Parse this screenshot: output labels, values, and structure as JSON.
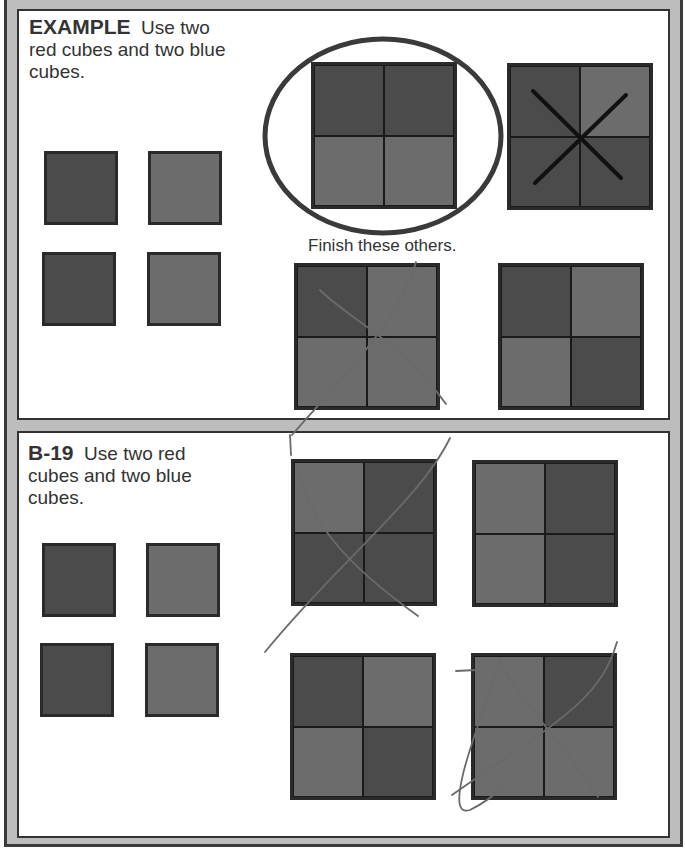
{
  "colors": {
    "frame": "#bdbdbd",
    "dark_cube": "#4b4b4b",
    "light_cube": "#6c6c6c",
    "border": "#2a2a2a"
  },
  "example": {
    "label": "EXAMPLE",
    "instruction_line1": "Use two",
    "instruction_line2": "red cubes and two blue",
    "instruction_line3": "cubes.",
    "loose_cubes": [
      "dark",
      "light",
      "dark",
      "light"
    ],
    "finish_text": "Finish these others.",
    "grids": [
      {
        "name": "circled-grid",
        "cells": [
          "dark",
          "dark",
          "light",
          "light"
        ],
        "mark": "circle"
      },
      {
        "name": "crossed-grid",
        "cells": [
          "dark",
          "light",
          "dark",
          "dark"
        ],
        "mark": "x"
      },
      {
        "name": "finish-grid-1",
        "cells": [
          "dark",
          "light",
          "light",
          "light"
        ],
        "mark": "pencil-x"
      },
      {
        "name": "finish-grid-2",
        "cells": [
          "dark",
          "light",
          "light",
          "dark"
        ],
        "mark": "none"
      }
    ]
  },
  "b19": {
    "label": "B-19",
    "instruction_line1": "Use two red",
    "instruction_line2": "cubes and two blue",
    "instruction_line3": "cubes.",
    "loose_cubes": [
      "dark",
      "light",
      "dark",
      "light"
    ],
    "grids": [
      {
        "name": "b19-grid-1",
        "cells": [
          "light",
          "dark",
          "dark",
          "dark"
        ],
        "mark": "pencil-x"
      },
      {
        "name": "b19-grid-2",
        "cells": [
          "light",
          "dark",
          "light",
          "dark"
        ],
        "mark": "none"
      },
      {
        "name": "b19-grid-3",
        "cells": [
          "dark",
          "light",
          "light",
          "dark"
        ],
        "mark": "none"
      },
      {
        "name": "b19-grid-4",
        "cells": [
          "light",
          "dark",
          "light",
          "light"
        ],
        "mark": "pencil-x"
      }
    ]
  }
}
